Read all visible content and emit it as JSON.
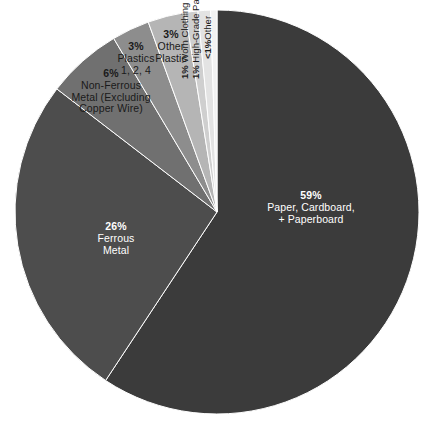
{
  "chart_data": {
    "type": "pie",
    "title": "",
    "subtitle": "",
    "xlabel": "",
    "ylabel": "",
    "legend_position": "none",
    "grid": false,
    "labels_on_slices": true,
    "total_percent": 100,
    "start_angle_deg": 0,
    "direction": "clockwise",
    "categories": [
      "Paper, Cardboard, + Paperboard",
      "Ferrous Metal",
      "Non-Ferrous Metal (Excluding Copper Wire)",
      "Plastics 1, 2, 4",
      "Other Plastic",
      "Worn Clothing",
      "High-Grade Paper",
      "Other"
    ],
    "values": [
      59,
      26,
      6,
      3,
      3,
      1,
      1,
      0.5
    ],
    "value_labels": [
      "59%",
      "26%",
      "6%",
      "3%",
      "3%",
      "1%",
      "1%",
      "<1%"
    ],
    "colors": [
      "#3b3b3b",
      "#4d4d4d",
      "#707070",
      "#8d8d8d",
      "#b5b5b5",
      "#cfcfcf",
      "#e3e3e3",
      "#f2f2f2"
    ],
    "slices": [
      {
        "id": "paper-cardboard-paperboard",
        "pct_label": "59%",
        "name_line1": "Paper, Cardboard,",
        "name_line2": "+ Paperboard",
        "value": 59,
        "color": "#3b3b3b",
        "label_placement": "inside",
        "label_color": "#ffffff"
      },
      {
        "id": "ferrous-metal",
        "pct_label": "26%",
        "name_line1": "Ferrous",
        "name_line2": "Metal",
        "value": 26,
        "color": "#4d4d4d",
        "label_placement": "inside",
        "label_color": "#ffffff"
      },
      {
        "id": "non-ferrous-metal",
        "pct_label": "6%",
        "name_line1": "Non-Ferrous",
        "name_line2": "Metal (Excluding",
        "name_line3": "Copper Wire)",
        "value": 6,
        "color": "#707070",
        "label_placement": "outside",
        "label_color": "#1a1a1a"
      },
      {
        "id": "plastics-1-2-4",
        "pct_label": "3%",
        "name_line1": "Plastics",
        "name_line2": "1, 2, 4",
        "value": 3,
        "color": "#8d8d8d",
        "label_placement": "outside",
        "label_color": "#1a1a1a"
      },
      {
        "id": "other-plastic",
        "pct_label": "3%",
        "name_line1": "Other",
        "name_line2": "Plastic",
        "value": 3,
        "color": "#b5b5b5",
        "label_placement": "outside",
        "label_color": "#1a1a1a"
      },
      {
        "id": "worn-clothing",
        "pct_label": "1%",
        "name_line1": "Worn Clothing",
        "value": 1,
        "color": "#cfcfcf",
        "label_placement": "outside-rotated",
        "label_color": "#1a1a1a"
      },
      {
        "id": "high-grade-paper",
        "pct_label": "1%",
        "name_line1": "High-Grade Paper",
        "value": 1,
        "color": "#e3e3e3",
        "label_placement": "outside-rotated",
        "label_color": "#1a1a1a"
      },
      {
        "id": "other",
        "pct_label": "<1%",
        "name_line1": "Other",
        "value": 0.5,
        "color": "#f2f2f2",
        "label_placement": "outside-rotated",
        "label_color": "#1a1a1a"
      }
    ]
  },
  "page": {
    "background": "#ffffff",
    "separator_color": "#ffffff"
  }
}
